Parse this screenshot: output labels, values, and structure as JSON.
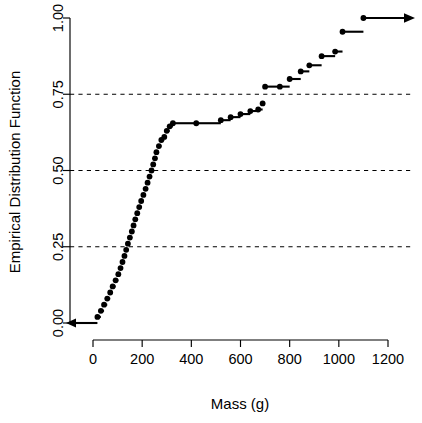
{
  "chart_data": {
    "type": "line",
    "subtype": "ecdf-step",
    "title": "",
    "xlabel": "Mass (g)",
    "ylabel": "Empirical Distribution Function",
    "xlim": [
      -60,
      1290
    ],
    "ylim": [
      0.0,
      1.0
    ],
    "xticks": [
      0,
      200,
      400,
      600,
      800,
      1000,
      1200
    ],
    "xtick_labels": [
      "0",
      "200",
      "400",
      "600",
      "800",
      "1000",
      "1200"
    ],
    "yticks": [
      0.0,
      0.25,
      0.5,
      0.75,
      1.0
    ],
    "ytick_labels": [
      "0.00",
      "0.25",
      "0.50",
      "0.75",
      "1.00"
    ],
    "grid": true,
    "gridlines_y": [
      0.25,
      0.5,
      0.75
    ],
    "grid_style": "dashed",
    "legend": "none",
    "point_color": "#000000",
    "line_color": "#000000",
    "left_tail_arrow": true,
    "right_tail_arrow": true,
    "n_points": 50,
    "x": [
      18,
      32,
      45,
      58,
      70,
      80,
      92,
      103,
      112,
      120,
      128,
      135,
      142,
      150,
      158,
      165,
      172,
      180,
      188,
      196,
      205,
      214,
      222,
      230,
      238,
      245,
      252,
      258,
      268,
      278,
      290,
      300,
      312,
      325,
      420,
      520,
      560,
      600,
      640,
      672,
      690,
      700,
      760,
      800,
      845,
      880,
      930,
      985,
      1015,
      1100
    ],
    "y": [
      0.02,
      0.04,
      0.06,
      0.08,
      0.1,
      0.12,
      0.14,
      0.16,
      0.18,
      0.2,
      0.22,
      0.24,
      0.26,
      0.28,
      0.3,
      0.32,
      0.34,
      0.36,
      0.38,
      0.4,
      0.42,
      0.44,
      0.46,
      0.48,
      0.5,
      0.52,
      0.54,
      0.56,
      0.58,
      0.6,
      0.61,
      0.63,
      0.645,
      0.655,
      0.655,
      0.665,
      0.675,
      0.685,
      0.695,
      0.7,
      0.72,
      0.775,
      0.775,
      0.8,
      0.825,
      0.845,
      0.875,
      0.89,
      0.955,
      1.0
    ]
  }
}
